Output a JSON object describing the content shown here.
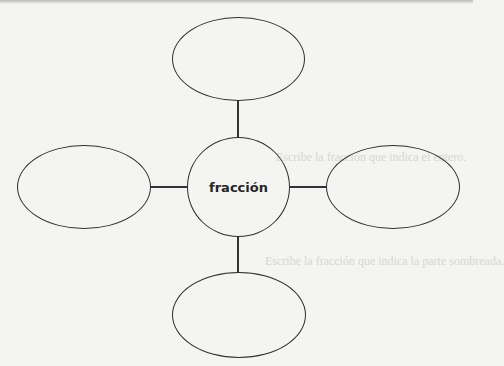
{
  "diagram": {
    "type": "concept-map",
    "center": {
      "label": "fracción"
    },
    "branches": [
      {
        "id": "top",
        "label": ""
      },
      {
        "id": "left",
        "label": ""
      },
      {
        "id": "right",
        "label": ""
      },
      {
        "id": "bottom",
        "label": ""
      }
    ]
  },
  "background_bleed": {
    "line1": "Escribe la fracción que indica el entero.",
    "line2": "Escribe la fracción que indica la parte sombreada."
  },
  "colors": {
    "stroke": "#2e2e2e",
    "background": "#f4f4f2"
  }
}
